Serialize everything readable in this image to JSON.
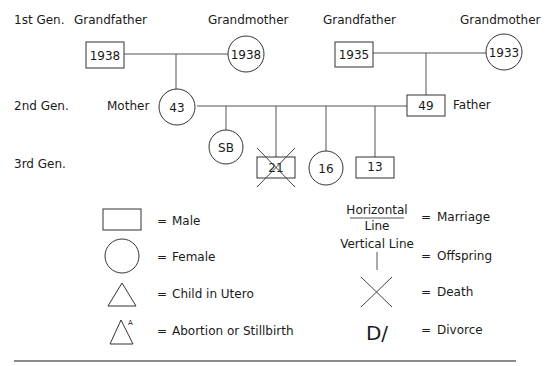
{
  "generations": {
    "first": "1st Gen.",
    "second": "2nd Gen.",
    "third": "3rd Gen."
  },
  "first_gen": {
    "maternal": {
      "grandfather_label": "Grandfather",
      "grandfather_value": "1938",
      "grandmother_label": "Grandmother",
      "grandmother_value": "1938"
    },
    "paternal": {
      "grandfather_label": "Grandfather",
      "grandfather_value": "1935",
      "grandmother_label": "Grandmother",
      "grandmother_value": "1933"
    }
  },
  "second_gen": {
    "mother_label": "Mother",
    "mother_value": "43",
    "father_label": "Father",
    "father_value": "49"
  },
  "third_gen": {
    "children": [
      {
        "sex": "female",
        "value": "SB",
        "deceased": false
      },
      {
        "sex": "male",
        "value": "21",
        "deceased": true
      },
      {
        "sex": "female",
        "value": "16",
        "deceased": false
      },
      {
        "sex": "male",
        "value": "13",
        "deceased": false
      }
    ]
  },
  "legend": {
    "equals": "=",
    "male": "Male",
    "female": "Female",
    "child_in_utero": "Child in Utero",
    "abortion_stillbirth": "Abortion or Stillbirth",
    "abortion_marker": "A",
    "horizontal_line_top": "Horizontal",
    "horizontal_line_bottom": "Line",
    "marriage": "Marriage",
    "vertical_line": "Vertical Line",
    "offspring": "Offspring",
    "death": "Death",
    "divorce_symbol": "D/",
    "divorce": "Divorce"
  },
  "colors": {
    "stroke": "#333333",
    "text": "#1a1a1a",
    "background": "#ffffff"
  }
}
